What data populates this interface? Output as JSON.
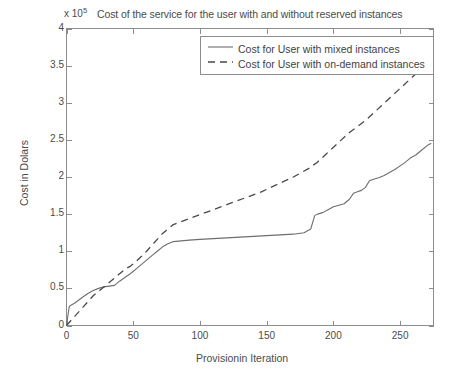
{
  "chart_data": {
    "type": "line",
    "title": "Cost of the service for the user with and without reserved instances",
    "xlabel": "Provisionin Iteration",
    "ylabel": "Cost in Dolars",
    "y_exponent_prefix": "x 10",
    "y_exponent_power": "5",
    "xlim": [
      0,
      275
    ],
    "ylim": [
      0,
      4
    ],
    "grid": false,
    "legend_position": "top-right",
    "xticks": [
      0,
      50,
      100,
      150,
      200,
      250
    ],
    "xtick_labels": [
      "0",
      "50",
      "100",
      "150",
      "200",
      "250"
    ],
    "yticks": [
      0,
      0.5,
      1,
      1.5,
      2,
      2.5,
      3,
      3.5,
      4
    ],
    "ytick_labels": [
      "0",
      "0.5",
      "1",
      "1.5",
      "2",
      "2.5",
      "3",
      "3.5",
      "4"
    ],
    "series": [
      {
        "name": "Cost for User with mixed instances",
        "style": "solid",
        "color": "#6e6e6e",
        "x": [
          0,
          2,
          3,
          6,
          9,
          12,
          16,
          20,
          24,
          28,
          32,
          36,
          40,
          44,
          48,
          52,
          56,
          60,
          64,
          68,
          72,
          76,
          80,
          86,
          92,
          100,
          110,
          120,
          130,
          140,
          150,
          160,
          170,
          178,
          183,
          186,
          188,
          192,
          196,
          200,
          204,
          208,
          212,
          215,
          218,
          221,
          224,
          227,
          230,
          234,
          238,
          242,
          246,
          250,
          254,
          258,
          262,
          266,
          270,
          273
        ],
        "y": [
          0.0,
          0.25,
          0.27,
          0.3,
          0.34,
          0.38,
          0.43,
          0.47,
          0.5,
          0.52,
          0.53,
          0.54,
          0.6,
          0.65,
          0.7,
          0.76,
          0.82,
          0.88,
          0.94,
          1.0,
          1.06,
          1.1,
          1.13,
          1.14,
          1.15,
          1.16,
          1.17,
          1.18,
          1.19,
          1.2,
          1.21,
          1.22,
          1.23,
          1.25,
          1.3,
          1.48,
          1.5,
          1.52,
          1.56,
          1.6,
          1.62,
          1.64,
          1.7,
          1.78,
          1.8,
          1.82,
          1.86,
          1.95,
          1.97,
          1.99,
          2.02,
          2.06,
          2.1,
          2.15,
          2.2,
          2.26,
          2.3,
          2.36,
          2.42,
          2.45
        ]
      },
      {
        "name": "Cost for User with on-demand instances",
        "style": "dashed",
        "color": "#4a4a4a",
        "x": [
          0,
          4,
          8,
          12,
          16,
          20,
          24,
          28,
          32,
          36,
          40,
          44,
          48,
          52,
          56,
          60,
          64,
          68,
          72,
          76,
          80,
          86,
          92,
          98,
          104,
          110,
          116,
          122,
          128,
          134,
          140,
          146,
          152,
          158,
          164,
          170,
          176,
          182,
          188,
          194,
          200,
          206,
          212,
          218,
          224,
          230,
          236,
          242,
          248,
          254,
          260,
          266,
          270,
          273
        ],
        "y": [
          0.0,
          0.08,
          0.16,
          0.24,
          0.32,
          0.4,
          0.46,
          0.52,
          0.58,
          0.64,
          0.7,
          0.76,
          0.8,
          0.86,
          0.93,
          1.0,
          1.08,
          1.16,
          1.24,
          1.3,
          1.36,
          1.4,
          1.44,
          1.48,
          1.52,
          1.56,
          1.6,
          1.64,
          1.68,
          1.72,
          1.76,
          1.8,
          1.85,
          1.9,
          1.95,
          2.0,
          2.06,
          2.12,
          2.2,
          2.3,
          2.4,
          2.5,
          2.6,
          2.68,
          2.76,
          2.86,
          2.96,
          3.06,
          3.16,
          3.26,
          3.36,
          3.46,
          3.52,
          3.55
        ]
      }
    ]
  },
  "colors": {
    "axis": "#8c8c8c",
    "solid_series": "#6e6e6e",
    "dashed_series": "#4a4a4a",
    "background": "#ffffff"
  }
}
